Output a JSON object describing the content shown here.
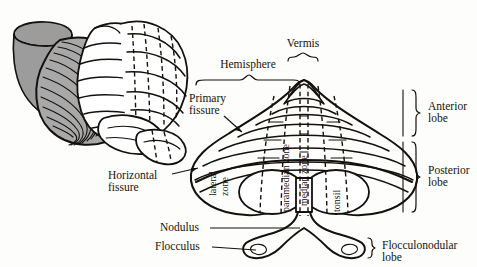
{
  "figure": {
    "width": 477,
    "height": 267,
    "background": "#fdfdfb",
    "ink": "#14100d",
    "shade": "#9c9c9c"
  },
  "labels": {
    "vermis": "Vermis",
    "hemisphere": "Hemisphere",
    "primary_fissure": "Primary\nfissure",
    "primary_fissure_line1": "Primary",
    "primary_fissure_line2": "fissure",
    "horizontal_fissure_line1": "Horizontal",
    "horizontal_fissure_line2": "fissure",
    "nodulus": "Nodulus",
    "flocculus": "Flocculus",
    "anterior_lobe_line1": "Anterior",
    "anterior_lobe_line2": "lobe",
    "posterior_lobe_line1": "Posterior",
    "posterior_lobe_line2": "lobe",
    "flocculonodular_lobe_line1": "Flocculonodular",
    "flocculonodular_lobe_line2": "lobe"
  },
  "zones": {
    "lateral_line1": "lateral",
    "lateral_line2": "zone",
    "paramedian": "paramedian zone",
    "median": "median zone",
    "tonsil": "tonsil"
  },
  "panels": {
    "left_view": "three-dimensional postero-lateral view of cerebellum and brainstem",
    "right_view": "flattened schematic posterior view of cerebellum"
  }
}
